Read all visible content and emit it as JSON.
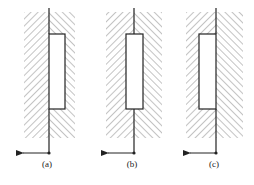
{
  "figure": {
    "panels": [
      {
        "id": "a",
        "label": "(a)",
        "line_x": 49,
        "rect": {
          "x": 49,
          "w": 16
        },
        "hatch_left": [
          24,
          49
        ],
        "hatch_right": [
          49,
          75
        ],
        "label_x": 47
      },
      {
        "id": "b",
        "label": "(b)",
        "line_x": 134,
        "rect": {
          "x": 126,
          "w": 17
        },
        "hatch_left": [
          106,
          134
        ],
        "hatch_right": [
          134,
          162
        ],
        "label_x": 132
      },
      {
        "id": "c",
        "label": "(c)",
        "line_x": 216,
        "rect": {
          "x": 199,
          "w": 17
        },
        "hatch_left": [
          186,
          216
        ],
        "hatch_right": [
          216,
          243
        ],
        "label_x": 214
      }
    ],
    "hatch_top": 12,
    "hatch_bottom": 138,
    "rect_top": 34,
    "rect_bottom": 109,
    "line_top": 8,
    "arrow_y": 153,
    "arrow_length": 32,
    "label_y": 167,
    "colors": {
      "line": "#222222",
      "hatch": "#7a7a7a",
      "rect_fill": "#ffffff"
    }
  }
}
